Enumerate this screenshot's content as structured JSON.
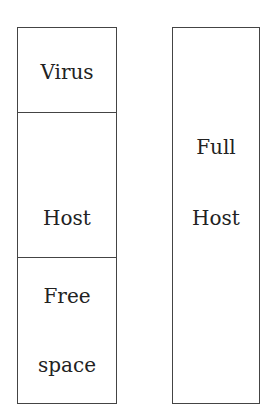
{
  "diagram": {
    "left_column": {
      "segments": [
        {
          "label": "Virus"
        },
        {
          "label": "Host"
        },
        {
          "label_line1": "Free",
          "label_line2": "space"
        }
      ]
    },
    "right_column": {
      "label_line1": "Full",
      "label_line2": "Host"
    },
    "colors": {
      "stroke": "#444444",
      "text": "#222222",
      "background": "#ffffff"
    }
  }
}
